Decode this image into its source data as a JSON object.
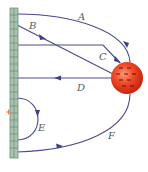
{
  "diagram": {
    "type": "electric-field-lines",
    "plate": {
      "name": "charged-plate",
      "fill": "#a8c4b0",
      "stroke": "#6f8f7c",
      "ticks": 20
    },
    "sphere": {
      "name": "negatively-charged-sphere",
      "charge_sign": "-",
      "color": "#e8361c",
      "highlight": "#ff8a6a"
    },
    "marker": {
      "symbol": "+",
      "color": "#e07a50"
    },
    "line_color": "#4a4a8c",
    "field_lines": [
      {
        "id": "A",
        "label": "A",
        "direction": "plate-to-sphere"
      },
      {
        "id": "B",
        "label": "B",
        "direction": "plate-to-sphere"
      },
      {
        "id": "C",
        "label": "C",
        "direction": "plate-to-sphere"
      },
      {
        "id": "D",
        "label": "D",
        "direction": "sphere-to-plate"
      },
      {
        "id": "E",
        "label": "E",
        "direction": "plate-to-plate"
      },
      {
        "id": "F",
        "label": "F",
        "direction": "plate-to-sphere"
      }
    ]
  }
}
